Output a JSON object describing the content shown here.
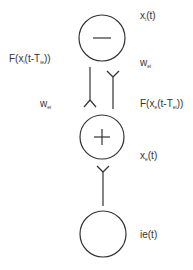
{
  "diagram": {
    "type": "neural-population-circuit",
    "colors": {
      "stroke": "#333333",
      "background": "#ffffff",
      "text": "#333333"
    },
    "nodes": [
      {
        "id": "inhibitory",
        "symbol": "minus",
        "label": "x",
        "label_sub": "i",
        "label_tail": "(t)"
      },
      {
        "id": "excitatory",
        "symbol": "plus",
        "label": "x",
        "label_sub": "e",
        "label_tail": "(t)"
      },
      {
        "id": "input",
        "symbol": "none",
        "label": "ie(t)"
      }
    ],
    "edges": [
      {
        "from": "inhibitory",
        "to": "excitatory",
        "function_label": {
          "pre": "F(x",
          "sub1": "i",
          "mid": "(t-T",
          "sub2": "ie",
          "post": "))"
        },
        "weight": {
          "main": "w",
          "sub": "ei"
        }
      },
      {
        "from": "excitatory",
        "to": "inhibitory",
        "function_label": {
          "pre": "F(x",
          "sub1": "e",
          "mid": "(t-T",
          "sub2": "ei",
          "post": "))"
        },
        "weight": {
          "main": "w",
          "sub": "ei"
        }
      },
      {
        "from": "input",
        "to": "excitatory"
      }
    ]
  }
}
